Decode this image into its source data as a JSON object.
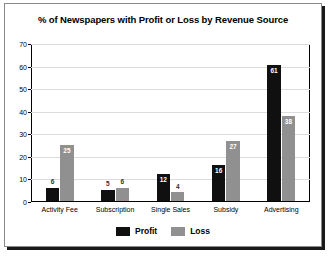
{
  "chart_data": {
    "type": "bar",
    "title": "% of Newspapers with Profit or Loss by Revenue Source",
    "xlabel": "",
    "ylabel": "",
    "ylim": [
      0,
      70
    ],
    "yticks": [
      0,
      10,
      20,
      30,
      40,
      50,
      60,
      70
    ],
    "grid": true,
    "legend_position": "bottom-center",
    "categories": [
      "Activity Fee",
      "Subscription",
      "Single Sales",
      "Subsidy",
      "Advertising"
    ],
    "series": [
      {
        "name": "Profit",
        "color": "#101010",
        "values": [
          6,
          5,
          12,
          16,
          61
        ]
      },
      {
        "name": "Loss",
        "color": "#909090",
        "values": [
          25,
          6,
          4,
          27,
          38
        ]
      }
    ]
  },
  "legend": {
    "items": [
      {
        "label": "Profit",
        "color": "#101010"
      },
      {
        "label": "Loss",
        "color": "#909090"
      }
    ]
  }
}
